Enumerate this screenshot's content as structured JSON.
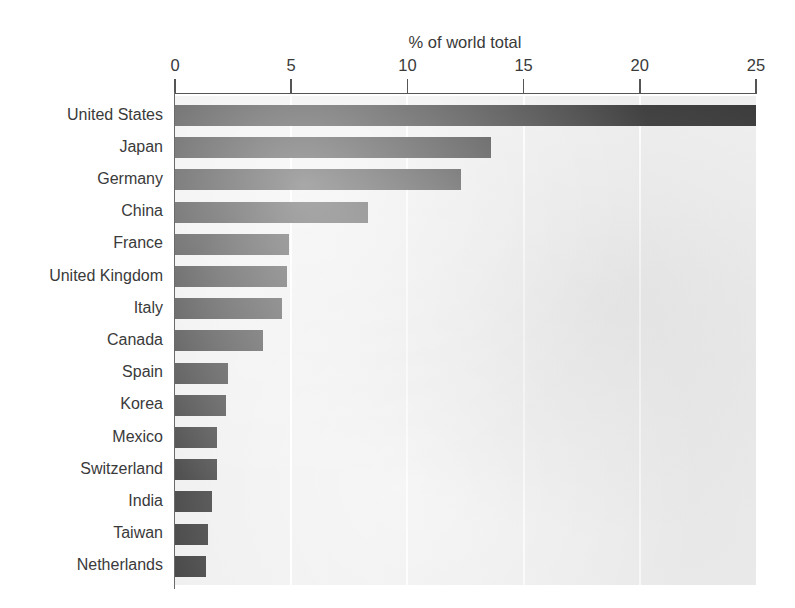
{
  "chart_data": {
    "type": "bar",
    "orientation": "horizontal",
    "title": "% of world total",
    "xlabel": "",
    "ylabel": "",
    "xlim": [
      0,
      25
    ],
    "xticks": [
      0,
      5,
      10,
      15,
      20,
      25
    ],
    "xticklabels": [
      "0",
      "5",
      "10",
      "15",
      "20",
      "25"
    ],
    "grid": "vertical-white-gridlines",
    "legend": "none",
    "bar_color": "#3b3b3b",
    "plot_background": "#efefef",
    "categories": [
      "United States",
      "Japan",
      "Germany",
      "China",
      "France",
      "United Kingdom",
      "Italy",
      "Canada",
      "Spain",
      "Korea",
      "Mexico",
      "Switzerland",
      "India",
      "Taiwan",
      "Netherlands"
    ],
    "values": [
      25.0,
      13.6,
      12.3,
      8.3,
      4.9,
      4.8,
      4.6,
      3.8,
      2.3,
      2.2,
      1.8,
      1.8,
      1.6,
      1.4,
      1.35
    ]
  }
}
